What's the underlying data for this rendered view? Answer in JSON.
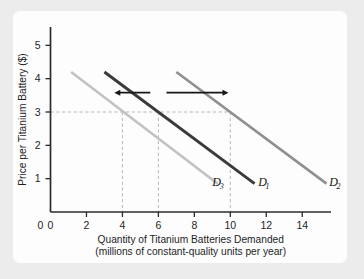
{
  "figure": {
    "background_color": "#ececed",
    "panel_color": "#fdfdfd"
  },
  "chart_data": {
    "type": "line",
    "title": "",
    "xlabel_line1": "Quantity of Titanium Batteries Demanded",
    "xlabel_line2": "(millions of constant-quality units per year)",
    "ylabel": "Price per Titanium Battery ($)",
    "xlim": [
      0,
      15.6
    ],
    "ylim": [
      0,
      5.55
    ],
    "xticks": [
      0,
      2,
      4,
      6,
      8,
      10,
      12,
      14
    ],
    "xtick_labels": [
      "0",
      "2",
      "4",
      "6",
      "8",
      "10",
      "12",
      "14"
    ],
    "yticks": [
      1,
      2,
      3,
      4,
      5
    ],
    "ytick_labels": [
      "1",
      "2",
      "3",
      "4",
      "5"
    ],
    "grid": false,
    "legend_position": "inline-curve-labels",
    "series": [
      {
        "name": "D3",
        "label": "D",
        "subscript": "3",
        "color": "#c2c2c2",
        "linewidth": 2.6,
        "x": [
          1.15,
          9.3
        ],
        "y": [
          4.2,
          0.85
        ],
        "price_at_3": 4.0,
        "label_x": 9.0,
        "label_y": 0.78
      },
      {
        "name": "D1",
        "label": "D",
        "subscript": "1",
        "color": "#3a3a3a",
        "linewidth": 2.9,
        "x": [
          3.0,
          11.35
        ],
        "y": [
          4.2,
          0.85
        ],
        "price_at_3": 6.0,
        "label_x": 11.55,
        "label_y": 0.78
      },
      {
        "name": "D2",
        "label": "D",
        "subscript": "2",
        "color": "#8f8f8f",
        "linewidth": 2.6,
        "x": [
          7.0,
          15.35
        ],
        "y": [
          4.2,
          0.85
        ],
        "price_at_3": 10.0,
        "label_x": 15.5,
        "label_y": 0.78
      }
    ],
    "reference_lines": {
      "horizontal_price": 3,
      "horizontal_extends_to_x": 10,
      "vertical_quantities": [
        4,
        6,
        10
      ],
      "color": "#b9b6b0",
      "style": "dashed"
    },
    "annotations": [
      {
        "name": "leftward-shift-arrow",
        "direction": "left",
        "x_start": 5.55,
        "x_end": 3.55,
        "y": 3.58,
        "color": "#171717"
      },
      {
        "name": "rightward-shift-arrow",
        "direction": "right",
        "x_start": 6.45,
        "x_end": 9.9,
        "y": 3.58,
        "color": "#171717"
      }
    ]
  }
}
